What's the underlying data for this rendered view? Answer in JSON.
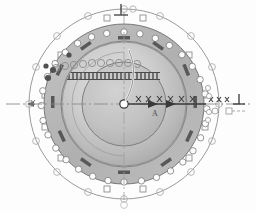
{
  "drawing": {
    "title": "Circular flange / casing end view",
    "type": "engineering-drawing",
    "style": "grayscale scanned blueprint",
    "background_color": "#fdfdfd"
  },
  "colors": {
    "paper": "#fdfdfd",
    "outer_line": "#8d8d8d",
    "ring_outer_fill": "#b9b9b9",
    "ring_mid_fill": "#c6c6c6",
    "disc_fill_light": "#d6d6d6",
    "disc_fill_dark": "#a9a9a9",
    "hole_white": "#fbfbfb",
    "lug_dark": "#5e5e5e",
    "line_dark": "#4a4a4a",
    "centerline": "#8a8a8a",
    "hatch": "#6f6f6f"
  },
  "geometry": {
    "center": {
      "x": 124,
      "y": 104
    },
    "outer_circle_r": 96,
    "bolt_circle_outer_r": 88,
    "flange_outer_r": 80,
    "flange_inner_r": 63,
    "disc_outer_r": 62,
    "inner_circle_r": 42,
    "hub_r": 4,
    "outer_marker_count": 16,
    "bolt_hole_count": 28,
    "lug_count": 12
  },
  "symbols": {
    "top_perpendicularity": "⊥",
    "right_perpendicularity": "⊥",
    "top_datum_circle": "○",
    "bottom_datum": "○"
  },
  "annotations": {
    "center_axis_label": "A",
    "right_tick_count": 4,
    "left_tick_count": 4,
    "horizontal_centerline": true,
    "vertical_centerline": true,
    "section_arrow_direction": "right",
    "leader_curve": true
  },
  "labels": {
    "top_symbol": "⊥",
    "right_symbol": "⊥",
    "axis_letter": "A"
  }
}
